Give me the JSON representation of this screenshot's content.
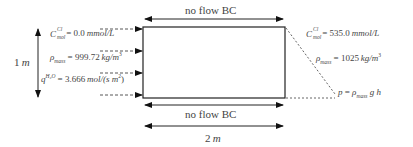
{
  "diagram": {
    "title": "",
    "top_boundary": {
      "label": "no flow BC"
    },
    "bottom_boundary": {
      "label": "no flow BC"
    },
    "width_dimension": {
      "label": "2 m",
      "value": "2",
      "unit": "m"
    },
    "height_dimension": {
      "label": "1 m",
      "value": "1",
      "unit": "m"
    },
    "left_boundary": {
      "concentration": {
        "symbol": "C",
        "sup": "Cl",
        "sub": "mol",
        "eq": " = ",
        "value": "0.0",
        "unit": "mmol/L"
      },
      "density": {
        "symbol": "ρ",
        "sub": "mass",
        "eq": " = ",
        "value": "999.72",
        "unit": "kg/m",
        "unit_sup": "3"
      },
      "flux": {
        "symbol": "q",
        "sup": "H₂O",
        "eq": " = ",
        "value": "3.666",
        "unit": "mol/(s m",
        "unit_sup": "2",
        "unit_end": ")"
      },
      "inflow_arrows": 4
    },
    "right_boundary": {
      "concentration": {
        "symbol": "C",
        "sup": "Cl",
        "sub": "mol",
        "eq": " = ",
        "value": "535.0",
        "unit": "mmol/L"
      },
      "density": {
        "symbol": "ρ",
        "sub": "mass",
        "eq": " = ",
        "value": "1025",
        "unit": "kg/m",
        "unit_sup": "3"
      },
      "pressure": {
        "symbol": "p",
        "eq": " = ",
        "rhs_symbol": "ρ",
        "rhs_sub": "mass",
        "rhs_tail": " g h"
      }
    },
    "colors": {
      "line": "#222222",
      "text": "#444444",
      "dash": "#555555"
    }
  }
}
